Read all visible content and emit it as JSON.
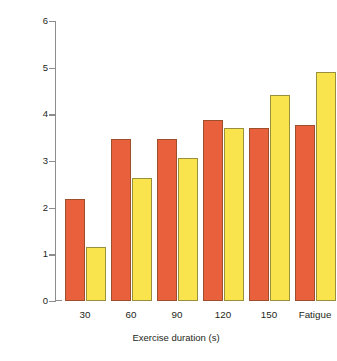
{
  "chart_data": {
    "type": "bar",
    "title": "",
    "xlabel": "Exercise duration (s)",
    "ylabel": "Change in Leucocytes (x109 .l–1)",
    "categories": [
      "30",
      "60",
      "90",
      "120",
      "150",
      "Fatigue"
    ],
    "series": [
      {
        "name": "series-a",
        "color": "#e8603c",
        "values": [
          2.19,
          3.48,
          3.48,
          3.87,
          3.7,
          3.78
        ]
      },
      {
        "name": "series-b",
        "color": "#f9e44d",
        "values": [
          1.16,
          2.64,
          3.07,
          3.7,
          4.41,
          4.9
        ]
      }
    ],
    "ylim": [
      0,
      6
    ],
    "yticks": [
      "0",
      "1",
      "2",
      "3",
      "4",
      "5",
      "6"
    ],
    "grid": false,
    "legend": "none"
  },
  "colors": {
    "series_a": "#e8603c",
    "series_b": "#f9e44d",
    "axis": "#8d8d8d",
    "text": "#231f20",
    "background": "#ffffff"
  }
}
